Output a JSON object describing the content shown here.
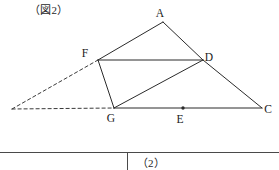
{
  "figure": {
    "caption": "（図2）",
    "labels": {
      "A": "A",
      "F": "F",
      "D": "D",
      "G": "G",
      "E": "E",
      "C": "C"
    },
    "colors": {
      "stroke": "#2b2b2b",
      "dashed_stroke": "#3a3a3a",
      "background": "#ffffff",
      "text": "#1a1a1a"
    }
  },
  "table": {
    "cell_2_label": "（2）"
  },
  "chart_data": {
    "type": "scatter",
    "title": "（図2）",
    "xlabel": "",
    "ylabel": "",
    "grid": false,
    "points": [
      {
        "name": "A",
        "x": 163,
        "y": 22,
        "label": "A",
        "label_dx": -3,
        "label_dy": -5
      },
      {
        "name": "F",
        "x": 98,
        "y": 60,
        "label": "F",
        "label_dx": -13,
        "label_dy": -3
      },
      {
        "name": "D",
        "x": 203,
        "y": 60,
        "label": "D",
        "label_dx": 6,
        "label_dy": 1
      },
      {
        "name": "G",
        "x": 114,
        "y": 108,
        "label": "G",
        "label_dx": -3,
        "label_dy": 14
      },
      {
        "name": "E",
        "x": 183,
        "y": 108,
        "label": "E",
        "label_dx": -3,
        "label_dy": 15
      },
      {
        "name": "C",
        "x": 262,
        "y": 108,
        "label": "C",
        "label_dx": 6,
        "label_dy": 5
      },
      {
        "name": "P",
        "x": 12,
        "y": 109,
        "label": "",
        "label_dx": 0,
        "label_dy": 0
      }
    ],
    "segments": [
      {
        "from": "F",
        "to": "A",
        "style": "solid"
      },
      {
        "from": "A",
        "to": "D",
        "style": "solid"
      },
      {
        "from": "F",
        "to": "D",
        "style": "solid"
      },
      {
        "from": "F",
        "to": "G",
        "style": "solid"
      },
      {
        "from": "G",
        "to": "D",
        "style": "solid"
      },
      {
        "from": "D",
        "to": "C",
        "style": "solid"
      },
      {
        "from": "G",
        "to": "C",
        "style": "solid"
      },
      {
        "from": "P",
        "to": "F",
        "style": "dashed"
      },
      {
        "from": "P",
        "to": "G",
        "style": "dashed"
      }
    ],
    "markers": [
      {
        "at": "E",
        "kind": "midpoint-dot"
      }
    ]
  }
}
